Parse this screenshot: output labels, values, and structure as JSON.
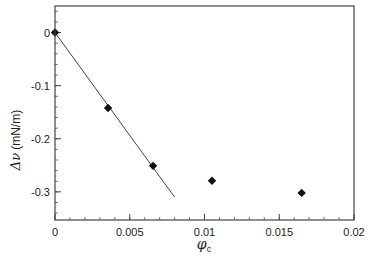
{
  "chart_data": {
    "type": "scatter",
    "title": "",
    "xlabel": "φ_c",
    "xlabel_main": "φ",
    "xlabel_sub": "c",
    "ylabel": "Δν (mN/m)",
    "ylabel_symbol": "Δν",
    "ylabel_unit": "(mN/m)",
    "xlim": [
      0,
      0.02
    ],
    "ylim": [
      -0.353,
      0.05
    ],
    "x_ticks": [
      0,
      0.005,
      0.01,
      0.015,
      0.02
    ],
    "x_tick_labels": [
      "0",
      "0.005",
      "0.01",
      "0.015",
      "0.02"
    ],
    "x_minor_step": 0.001,
    "y_ticks": [
      0,
      -0.1,
      -0.2,
      -0.3
    ],
    "y_tick_labels": [
      "0",
      "-0.1",
      "-0.2",
      "-0.3"
    ],
    "y_minor_step": 0.02,
    "grid": false,
    "legend": null,
    "series": [
      {
        "name": "data",
        "marker": "diamond",
        "color": "#111111",
        "x": [
          0,
          0.00355,
          0.00656,
          0.0105,
          0.0165
        ],
        "y": [
          0,
          -0.142,
          -0.251,
          -0.279,
          -0.302
        ]
      },
      {
        "name": "linear fit",
        "type": "line",
        "color": "#444444",
        "x": [
          0,
          0.008
        ],
        "y": [
          0,
          -0.31
        ]
      }
    ]
  }
}
